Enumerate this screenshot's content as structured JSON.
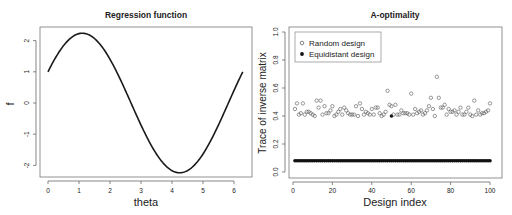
{
  "chart_data": [
    {
      "type": "line",
      "title": "Regression function",
      "xlabel": "theta",
      "ylabel": "f",
      "xlim": [
        0,
        6.2832
      ],
      "ylim": [
        -2.3,
        2.3
      ],
      "xticks": [
        0,
        1,
        2,
        3,
        4,
        5,
        6
      ],
      "yticks": [
        -2,
        -1,
        0,
        1,
        2
      ],
      "grid": false,
      "function": "f(theta) = sin(theta) + 2*cos(theta)? (approximately 2.236*sin(theta + 0.4636))",
      "series": [
        {
          "name": "f",
          "x": [
            0,
            0.5,
            1.0,
            1.107,
            1.5,
            2.0,
            2.5,
            3.0,
            3.5,
            4.0,
            4.249,
            4.5,
            5.0,
            5.5,
            6.0,
            6.2832
          ],
          "y": [
            1.0,
            1.71,
            2.11,
            2.24,
            2.08,
            1.08,
            -0.46,
            -1.84,
            -2.02,
            -1.91,
            -2.24,
            -2.12,
            -1.49,
            -0.28,
            0.84,
            1.0
          ]
        }
      ]
    },
    {
      "type": "scatter",
      "title": "A-optimality",
      "xlabel": "Design index",
      "ylabel": "Trace of inverse matrix",
      "xlim": [
        0,
        100
      ],
      "ylim": [
        0,
        1.0
      ],
      "xticks": [
        0,
        20,
        40,
        60,
        80,
        100
      ],
      "yticks": [
        0.0,
        0.2,
        0.4,
        0.6,
        0.8,
        1.0
      ],
      "grid": false,
      "legend": {
        "position": "top-left",
        "entries": [
          {
            "label": "Random design",
            "marker": "open-circle"
          },
          {
            "label": "Equidistant design",
            "marker": "filled-circle"
          }
        ]
      },
      "series": [
        {
          "name": "Random design",
          "marker": "open-circle",
          "x": [
            1,
            2,
            3,
            4,
            5,
            6,
            7,
            8,
            9,
            10,
            11,
            12,
            13,
            14,
            15,
            16,
            17,
            18,
            19,
            20,
            21,
            22,
            23,
            24,
            25,
            26,
            27,
            28,
            29,
            30,
            31,
            32,
            33,
            34,
            35,
            36,
            37,
            38,
            39,
            40,
            41,
            42,
            43,
            44,
            45,
            46,
            47,
            48,
            49,
            50,
            51,
            52,
            53,
            54,
            55,
            56,
            57,
            58,
            59,
            60,
            61,
            62,
            63,
            64,
            65,
            66,
            67,
            68,
            69,
            70,
            71,
            72,
            73,
            74,
            75,
            76,
            77,
            78,
            79,
            80,
            81,
            82,
            83,
            84,
            85,
            86,
            87,
            88,
            89,
            90,
            91,
            92,
            93,
            94,
            95,
            96,
            97,
            98,
            99,
            100
          ],
          "values": [
            0.45,
            0.49,
            0.41,
            0.42,
            0.49,
            0.41,
            0.43,
            0.43,
            0.42,
            0.41,
            0.4,
            0.51,
            0.46,
            0.51,
            0.41,
            0.47,
            0.42,
            0.42,
            0.44,
            0.47,
            0.4,
            0.41,
            0.43,
            0.45,
            0.41,
            0.46,
            0.44,
            0.42,
            0.41,
            0.41,
            0.41,
            0.47,
            0.4,
            0.49,
            0.45,
            0.41,
            0.43,
            0.42,
            0.41,
            0.45,
            0.41,
            0.46,
            0.46,
            0.42,
            0.4,
            0.41,
            0.43,
            0.58,
            0.48,
            0.47,
            0.41,
            0.48,
            0.41,
            0.41,
            0.44,
            0.42,
            0.42,
            0.42,
            0.41,
            0.56,
            0.41,
            0.45,
            0.42,
            0.43,
            0.44,
            0.41,
            0.42,
            0.44,
            0.47,
            0.53,
            0.45,
            0.4,
            0.68,
            0.53,
            0.46,
            0.46,
            0.48,
            0.41,
            0.45,
            0.43,
            0.43,
            0.44,
            0.41,
            0.43,
            0.46,
            0.41,
            0.41,
            0.43,
            0.46,
            0.41,
            0.4,
            0.51,
            0.41,
            0.44,
            0.41,
            0.42,
            0.42,
            0.43,
            0.44,
            0.49
          ]
        },
        {
          "name": "Equidistant design",
          "marker": "filled-circle",
          "x_range": [
            1,
            100
          ],
          "constant_value": 0.08,
          "highlight_point": {
            "x": 50,
            "value": 0.4
          }
        }
      ]
    }
  ],
  "panels": {
    "left": {
      "title": "Regression function",
      "xlabel": "theta",
      "ylabel": "f",
      "xticks": [
        "0",
        "1",
        "2",
        "3",
        "4",
        "5",
        "6"
      ],
      "yticks": [
        "-2",
        "-1",
        "0",
        "1",
        "2"
      ]
    },
    "right": {
      "title": "A-optimality",
      "xlabel": "Design index",
      "ylabel": "Trace of inverse matrix",
      "xticks": [
        "0",
        "20",
        "40",
        "60",
        "80",
        "100"
      ],
      "yticks": [
        "0.0",
        "0.2",
        "0.4",
        "0.6",
        "0.8",
        "1.0"
      ],
      "legend": [
        "Random design",
        "Equidistant design"
      ]
    }
  },
  "colors": {
    "line": "#1a1a1a",
    "axis": "#555555",
    "marker_open": "#555555",
    "marker_filled": "#111111"
  }
}
